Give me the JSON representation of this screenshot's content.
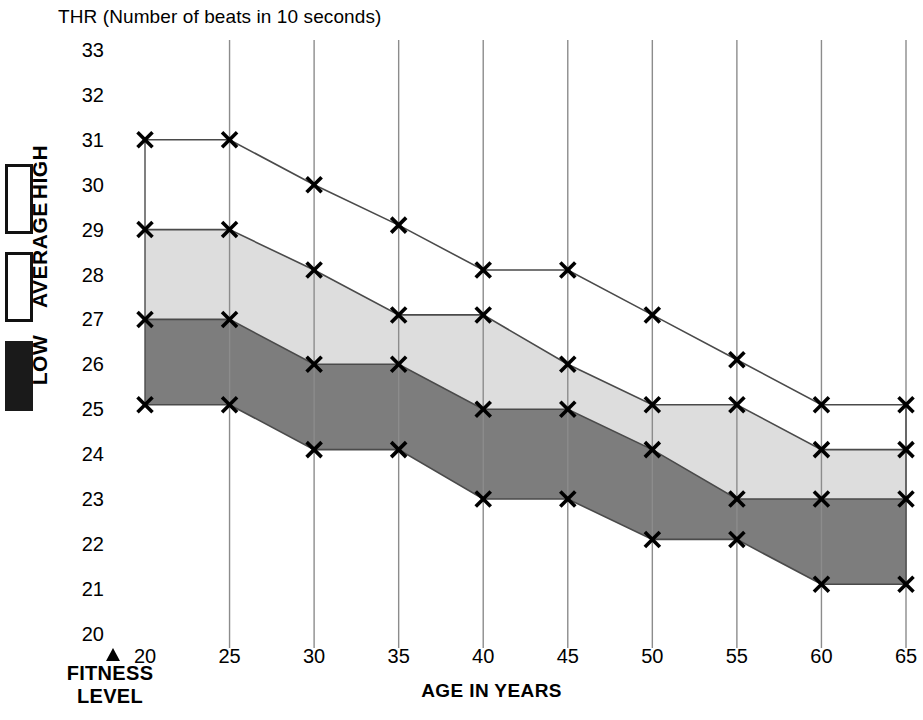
{
  "chart_data": {
    "type": "area",
    "title": "THR (Number of beats in 10 seconds)",
    "xlabel": "AGE IN YEARS",
    "ylabel": "THR (Number of beats in 10 seconds)",
    "x": [
      20,
      25,
      30,
      35,
      40,
      45,
      50,
      55,
      60,
      65
    ],
    "xtick_labels": [
      "20",
      "25",
      "30",
      "35",
      "40",
      "45",
      "50",
      "55",
      "60",
      "65"
    ],
    "ytick_labels": [
      "33",
      "32",
      "31",
      "30",
      "29",
      "28",
      "27",
      "26",
      "25",
      "24",
      "23",
      "22",
      "21",
      "20"
    ],
    "xlim": [
      20,
      65
    ],
    "ylim": [
      20,
      33
    ],
    "grid": "vertical",
    "legend_position": "left-vertical",
    "marker": "x",
    "series": [
      {
        "name": "HIGH upper bound",
        "band": "high",
        "fill": "none",
        "values": [
          31,
          31,
          30,
          29.1,
          28.1,
          28.1,
          27.1,
          26.1,
          25.1,
          25.1
        ]
      },
      {
        "name": "HIGH lower bound / AVERAGE upper bound",
        "band": "average",
        "fill": "#dddddd",
        "values": [
          29,
          29,
          28.1,
          27.1,
          27.1,
          26,
          25.1,
          25.1,
          24.1,
          24.1
        ]
      },
      {
        "name": "AVERAGE lower bound / LOW upper bound",
        "band": "low",
        "fill": "#7d7d7d",
        "values": [
          27,
          27,
          26,
          26,
          25,
          25,
          24.1,
          23,
          23,
          23
        ]
      },
      {
        "name": "LOW lower bound",
        "band": "low-bottom",
        "fill": "none",
        "values": [
          25.1,
          25.1,
          24.1,
          24.1,
          23,
          23,
          22.1,
          22.1,
          21.1,
          21.1
        ]
      }
    ],
    "bands": [
      {
        "name": "HIGH",
        "fill": "#ffffff",
        "upper_series": 0,
        "lower_series": 1
      },
      {
        "name": "AVERAGE",
        "fill": "#dddddd",
        "upper_series": 1,
        "lower_series": 2
      },
      {
        "name": "LOW",
        "fill": "#7d7d7d",
        "upper_series": 2,
        "lower_series": 3
      }
    ]
  },
  "legend": {
    "items": [
      {
        "label": "HIGH",
        "swatch_color": "#ffffff",
        "swatch_border": "#111111"
      },
      {
        "label": "AVERAGE",
        "swatch_color": "#ffffff",
        "swatch_border": "#111111"
      },
      {
        "label": "LOW",
        "swatch_color": "#1a1a1a",
        "swatch_border": "#1a1a1a"
      }
    ],
    "caption_line1": "FITNESS",
    "caption_line2": "LEVEL"
  },
  "colors": {
    "band_average": "#dddddd",
    "band_low": "#7d7d7d",
    "grid": "#8c8c8c",
    "line": "#4a4a4a",
    "marker": "#000000",
    "background": "#ffffff"
  }
}
